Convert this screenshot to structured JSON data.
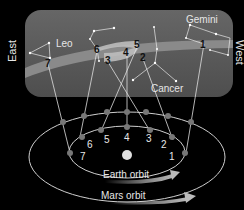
{
  "directions": {
    "east": "East",
    "west": "West"
  },
  "constellations": {
    "leo": "Leo",
    "gemini": "Gemini",
    "cancer": "Cancer"
  },
  "orbits": {
    "earth": "Earth orbit",
    "mars": "Mars orbit"
  },
  "positions": [
    "1",
    "2",
    "3",
    "4",
    "5",
    "6",
    "7"
  ],
  "colors": {
    "background": "#000000",
    "sky": "#5c5c5c",
    "ecliptic": "#8a8a8a",
    "loop": "#b5b5b5",
    "orbit_line": "#cfcfcf",
    "sun": "#e0e0e0"
  }
}
